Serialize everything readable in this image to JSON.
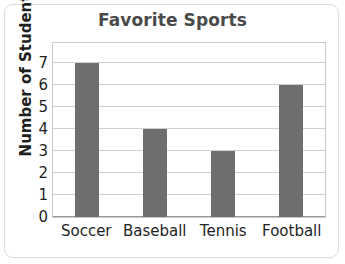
{
  "chart_data": {
    "type": "bar",
    "title": "Favorite Sports",
    "xlabel": "",
    "ylabel": "Number of Students",
    "categories": [
      "Soccer",
      "Baseball",
      "Tennis",
      "Football"
    ],
    "values": [
      7,
      4,
      3,
      6
    ],
    "ylim": [
      0,
      8
    ],
    "yticks": [
      0,
      1,
      2,
      3,
      4,
      5,
      6,
      7
    ],
    "ytick_labels": [
      "0",
      "1",
      "2",
      "3",
      "4",
      "5",
      "6",
      "7"
    ],
    "grid": "horizontal",
    "legend": "none",
    "bar_color": "#6e6e6e",
    "title_color": "#4a4a4a",
    "text_color": "#1f1f1f",
    "gridline_color": "#d0d0d0",
    "plot_border_color": "#c8c8c8",
    "background_color": "#ffffff",
    "frame_color": "#dcdcdc"
  }
}
